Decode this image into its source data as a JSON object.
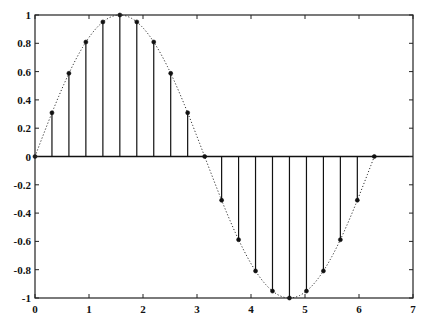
{
  "chart_data": {
    "type": "stem",
    "title": "",
    "xlabel": "",
    "ylabel": "",
    "xlim": [
      0,
      7
    ],
    "ylim": [
      -1,
      1
    ],
    "grid": false,
    "legend": null,
    "x_ticks": [
      0,
      1,
      2,
      3,
      4,
      5,
      6,
      7
    ],
    "x_tick_labels": [
      "0",
      "1",
      "2",
      "3",
      "4",
      "5",
      "6",
      "7"
    ],
    "y_ticks": [
      -1,
      -0.8,
      -0.6,
      -0.4,
      -0.2,
      0,
      0.2,
      0.4,
      0.6,
      0.8,
      1
    ],
    "y_tick_labels": [
      "-1",
      "-0.8",
      "-0.6",
      "-0.4",
      "-0.2",
      "0",
      "0.2",
      "0.4",
      "0.6",
      "0.8",
      "1"
    ],
    "series": [
      {
        "name": "sin(x) samples",
        "style": "stem with circle markers",
        "x": [
          0,
          0.314,
          0.628,
          0.942,
          1.257,
          1.571,
          1.885,
          2.199,
          2.513,
          2.827,
          3.142,
          3.456,
          3.77,
          4.084,
          4.398,
          4.712,
          5.027,
          5.341,
          5.655,
          5.969,
          6.283
        ],
        "values": [
          0,
          0.309,
          0.588,
          0.809,
          0.951,
          1.0,
          0.951,
          0.809,
          0.588,
          0.309,
          0,
          -0.309,
          -0.588,
          -0.809,
          -0.951,
          -1.0,
          -0.951,
          -0.809,
          -0.588,
          -0.309,
          0
        ]
      },
      {
        "name": "sin(x) continuous",
        "style": "dotted line",
        "function": "sin(x)",
        "x_range": [
          0,
          6.283
        ]
      }
    ],
    "baseline": 0
  },
  "colors": {
    "axes": "#222222",
    "stem": "#111111",
    "curve": "#333333",
    "background": "#ffffff"
  }
}
